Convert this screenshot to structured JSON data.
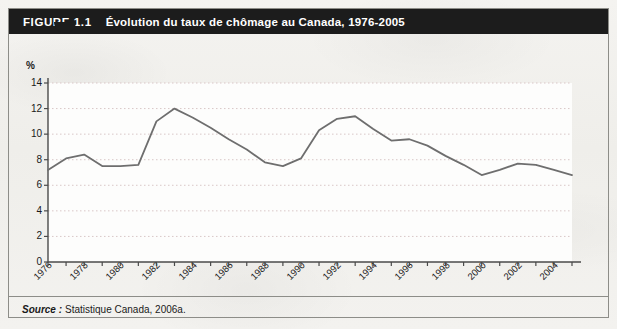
{
  "figure": {
    "number_label": "FIGURE 1.1",
    "title": "Évolution du taux de chômage au Canada, 1976-2005",
    "source_label": "Source :",
    "source_text": "Statistique Canada, 2006a.",
    "frame_color": "#8d8d88",
    "title_bar_color": "#1c1c1c",
    "page_background": "#f2f1ee"
  },
  "chart_data": {
    "type": "line",
    "title": "Évolution du taux de chômage au Canada, 1976-2005",
    "subtitle": "",
    "xlabel": "",
    "ylabel": "%",
    "y_unit_label": "%",
    "x": [
      1976,
      1977,
      1978,
      1979,
      1980,
      1981,
      1982,
      1983,
      1984,
      1985,
      1986,
      1987,
      1988,
      1989,
      1990,
      1991,
      1992,
      1993,
      1994,
      1995,
      1996,
      1997,
      1998,
      1999,
      2000,
      2001,
      2002,
      2003,
      2004,
      2005
    ],
    "values": [
      7.2,
      8.1,
      8.4,
      7.5,
      7.5,
      7.6,
      11.0,
      12.0,
      11.3,
      10.5,
      9.6,
      8.8,
      7.8,
      7.5,
      8.1,
      10.3,
      11.2,
      11.4,
      10.4,
      9.5,
      9.6,
      9.1,
      8.3,
      7.6,
      6.8,
      7.2,
      7.7,
      7.6,
      7.2,
      6.8
    ],
    "series": [
      {
        "name": "Taux de chômage",
        "color": "#6e6e6e",
        "values": [
          7.2,
          8.1,
          8.4,
          7.5,
          7.5,
          7.6,
          11.0,
          12.0,
          11.3,
          10.5,
          9.6,
          8.8,
          7.8,
          7.5,
          8.1,
          10.3,
          11.2,
          11.4,
          10.4,
          9.5,
          9.6,
          9.1,
          8.3,
          7.6,
          6.8,
          7.2,
          7.7,
          7.6,
          7.2,
          6.8
        ]
      }
    ],
    "xlim": [
      1976,
      2005
    ],
    "ylim": [
      0,
      14
    ],
    "y_ticks": [
      0,
      2,
      4,
      6,
      8,
      10,
      12,
      14
    ],
    "y_tick_labels": [
      "0",
      "2",
      "4",
      "6",
      "8",
      "10",
      "12",
      "14"
    ],
    "x_ticks": [
      1976,
      1977,
      1978,
      1979,
      1980,
      1981,
      1982,
      1983,
      1984,
      1985,
      1986,
      1987,
      1988,
      1989,
      1990,
      1991,
      1992,
      1993,
      1994,
      1995,
      1996,
      1997,
      1998,
      1999,
      2000,
      2001,
      2002,
      2003,
      2004,
      2005
    ],
    "x_tick_labels": [
      "1976",
      "1978",
      "1980",
      "1982",
      "1984",
      "1986",
      "1988",
      "1990",
      "1992",
      "1994",
      "1996",
      "1998",
      "2000",
      "2002",
      "2004"
    ],
    "x_tick_label_values": [
      1976,
      1978,
      1980,
      1982,
      1984,
      1986,
      1988,
      1990,
      1992,
      1994,
      1996,
      1998,
      2000,
      2002,
      2004
    ],
    "grid": true,
    "grid_style": "dotted-horizontal",
    "grid_color": "#d9c7c7",
    "legend": false,
    "legend_position": "none",
    "plot_background": "#fdfdfc",
    "axis_color": "#4a4a4a",
    "line_color": "#6e6e6e",
    "line_width": 1.8
  }
}
